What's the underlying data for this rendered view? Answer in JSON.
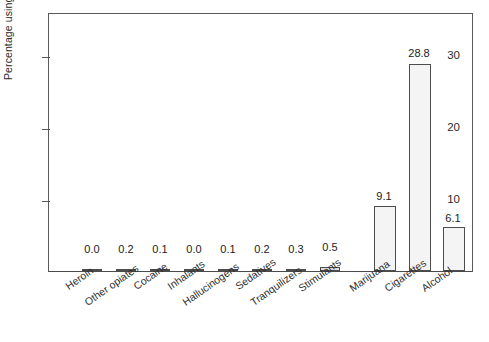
{
  "chart_data": {
    "type": "bar",
    "title": "",
    "subtitle": "",
    "xlabel": "",
    "ylabel": "Percentage using daily",
    "ylim": [
      0,
      36
    ],
    "yticks": [
      10,
      20,
      30
    ],
    "ytick_labels": [
      "10",
      "20",
      "30"
    ],
    "grid": false,
    "legend": null,
    "categories": [
      "Heroin",
      "Other opiates",
      "Cocaine",
      "Inhalants",
      "Hallucinogens",
      "Sedatives",
      "Tranquilizers",
      "Stimulants",
      "Marijuana",
      "Cigarettes",
      "Alcohol"
    ],
    "values": [
      0.0,
      0.2,
      0.1,
      0.0,
      0.1,
      0.2,
      0.3,
      0.5,
      9.1,
      28.8,
      6.1
    ],
    "data_labels": [
      "0.0",
      "0.2",
      "0.1",
      "0.0",
      "0.1",
      "0.2",
      "0.3",
      "0.5",
      "9.1",
      "28.8",
      "6.1"
    ],
    "bar_fill_color": "#f4f4f4",
    "bar_edge_color": "#4d4d4d",
    "axis_color": "#5a5a5a",
    "text_color": "#2b2b2b"
  }
}
